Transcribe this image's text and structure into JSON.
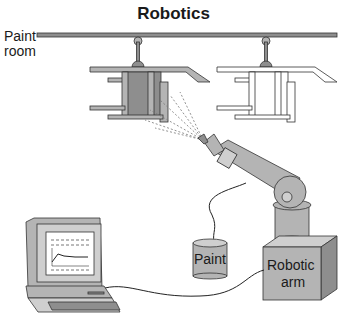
{
  "title": "Robotics",
  "labels": {
    "paint_room_line1": "Paint",
    "paint_room_line2": "room",
    "paint_can": "Paint",
    "robotic_arm_line1": "Robotic",
    "robotic_arm_line2": "arm"
  },
  "components": [
    {
      "id": "overhead-rail",
      "description": "Overhead conveyor rail in paint room"
    },
    {
      "id": "part-being-painted",
      "description": "Shaded (painted) suspended part"
    },
    {
      "id": "unpainted-part",
      "description": "White (unpainted) suspended part"
    },
    {
      "id": "spray-nozzle",
      "description": "Spray gun at end of robotic arm"
    },
    {
      "id": "robotic-arm",
      "description": "Articulated robotic arm on base"
    },
    {
      "id": "paint-can",
      "description": "Paint supply with hose to arm"
    },
    {
      "id": "computer",
      "description": "Control computer cabled to robot base"
    }
  ],
  "colors": {
    "fill_gray": "#b4b4b4",
    "outline": "#333333",
    "background": "#ffffff"
  }
}
